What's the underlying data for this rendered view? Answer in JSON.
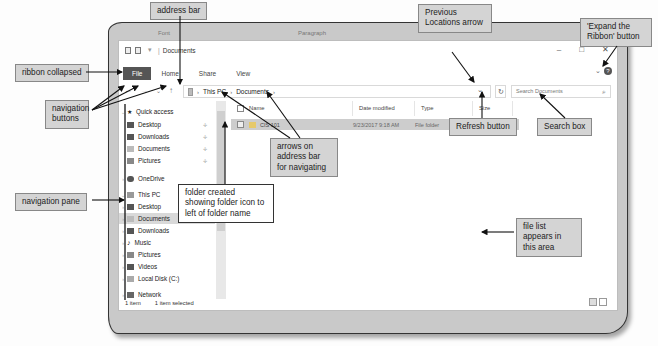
{
  "background_ribbon": {
    "font_label": "Font",
    "paragraph_label": "Paragraph"
  },
  "window": {
    "title": "Documents",
    "controls": {
      "minimize": "–",
      "maximize": "□",
      "close": "✕"
    },
    "tabs": {
      "file": "File",
      "home": "Home",
      "share": "Share",
      "view": "View"
    },
    "expand_ribbon_icon": "⌄",
    "help_icon": "?"
  },
  "navigation": {
    "back_icon": "←",
    "forward_icon": "→",
    "recent_icon": "⌄",
    "up_icon": "↑"
  },
  "address_bar": {
    "separator": "›",
    "crumbs": [
      "This PC",
      "Documents"
    ],
    "previous_locations_icon": "⌄",
    "refresh_icon": "↻"
  },
  "search": {
    "placeholder": "Search Documents",
    "icon": "⌕"
  },
  "nav_pane": {
    "items": [
      {
        "label": "Quick access",
        "icon": "star",
        "expand": "⌄"
      },
      {
        "label": "Desktop",
        "icon": "folder",
        "pin": "✢"
      },
      {
        "label": "Downloads",
        "icon": "download",
        "pin": "✢"
      },
      {
        "label": "Documents",
        "icon": "document",
        "pin": "✢"
      },
      {
        "label": "Pictures",
        "icon": "pictures",
        "pin": "✢"
      },
      {
        "label": "OneDrive",
        "icon": "cloud",
        "expand": "›"
      },
      {
        "label": "This PC",
        "icon": "computer",
        "expand": "⌄"
      },
      {
        "label": "Desktop",
        "icon": "folder",
        "expand": "›"
      },
      {
        "label": "Documents",
        "icon": "document",
        "expand": "›",
        "selected": true
      },
      {
        "label": "Downloads",
        "icon": "download",
        "expand": "›"
      },
      {
        "label": "Music",
        "icon": "music",
        "expand": "›"
      },
      {
        "label": "Pictures",
        "icon": "pictures",
        "expand": "›"
      },
      {
        "label": "Videos",
        "icon": "videos",
        "expand": "›"
      },
      {
        "label": "Local Disk (C:)",
        "icon": "disk",
        "expand": "›"
      },
      {
        "label": "Network",
        "icon": "network",
        "expand": "›"
      }
    ]
  },
  "file_list": {
    "columns": [
      "Name",
      "Date modified",
      "Type",
      "Size"
    ],
    "rows": [
      {
        "name": "CIS 101",
        "date": "9/23/2017 9:18 AM",
        "type": "File folder",
        "size": ""
      }
    ]
  },
  "status": {
    "count": "1 item",
    "selected": "1 item selected"
  },
  "callouts": {
    "address_bar": "address bar",
    "ribbon_collapsed": "ribbon collapsed",
    "navigation_buttons": "navigation buttons",
    "navigation_pane": "navigation pane",
    "previous_locations": "Previous Locations arrow",
    "expand_ribbon": "'Expand the Ribbon' button",
    "refresh_button": "Refresh button",
    "search_box": "Search box",
    "arrows_address_bar": "arrows on address bar for navigating",
    "folder_created": "folder created showing folder icon to left of folder name",
    "file_list_area": "file list appears in this area"
  }
}
